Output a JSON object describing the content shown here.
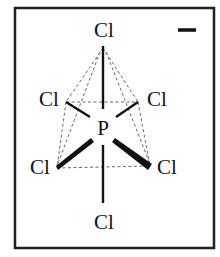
{
  "diagram": {
    "type": "molecular-geometry",
    "molecule": "PCl6-",
    "geometry": "octahedral",
    "charge_label": "−",
    "central_atom": {
      "label": "P"
    },
    "ligands": [
      {
        "id": "axial-top",
        "label": "Cl"
      },
      {
        "id": "equatorial-back-left",
        "label": "Cl"
      },
      {
        "id": "equatorial-back-right",
        "label": "Cl"
      },
      {
        "id": "equatorial-front-left",
        "label": "Cl"
      },
      {
        "id": "equatorial-front-right",
        "label": "Cl"
      },
      {
        "id": "axial-bottom",
        "label": "Cl"
      }
    ],
    "colors": {
      "ink": "#111111",
      "frame": "#222222",
      "guide": "#666666",
      "background": "#ffffff"
    }
  }
}
